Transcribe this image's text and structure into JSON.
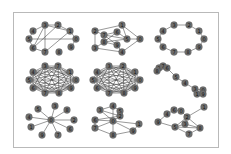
{
  "figure": {
    "layout": "3x3 grid of network graphs",
    "node_color": "#6e6e6e",
    "edge_color": "#333333",
    "frame_color": "#b9b9b9",
    "panels": [
      {
        "name": "graph-1",
        "nodes": [
          {
            "id": "3",
            "x": 45,
            "y": 25
          },
          {
            "id": "2",
            "x": 58,
            "y": 25
          },
          {
            "id": "1",
            "x": 70,
            "y": 31
          },
          {
            "id": "0",
            "x": 76,
            "y": 39
          },
          {
            "id": "9",
            "x": 71,
            "y": 47
          },
          {
            "id": "8",
            "x": 59,
            "y": 52
          },
          {
            "id": "7",
            "x": 45,
            "y": 52
          },
          {
            "id": "6",
            "x": 33,
            "y": 48
          },
          {
            "id": "5",
            "x": 29,
            "y": 39
          },
          {
            "id": "4",
            "x": 33,
            "y": 31
          }
        ],
        "edges": [
          [
            "3",
            "2"
          ],
          [
            "2",
            "1"
          ],
          [
            "1",
            "0"
          ],
          [
            "0",
            "9"
          ],
          [
            "5",
            "0"
          ],
          [
            "3",
            "7"
          ],
          [
            "2",
            "6"
          ],
          [
            "3",
            "6"
          ],
          [
            "4",
            "5"
          ],
          [
            "5",
            "6"
          ],
          [
            "6",
            "7"
          ],
          [
            "3",
            "1"
          ],
          [
            "7",
            "1"
          ],
          [
            "4",
            "3"
          ]
        ]
      },
      {
        "name": "graph-2",
        "nodes": [
          {
            "id": "1",
            "x": 122,
            "y": 25
          },
          {
            "id": "2",
            "x": 95,
            "y": 31
          },
          {
            "id": "6",
            "x": 117,
            "y": 32
          },
          {
            "id": "7",
            "x": 104,
            "y": 35
          },
          {
            "id": "5",
            "x": 127,
            "y": 39
          },
          {
            "id": "0",
            "x": 140,
            "y": 39
          },
          {
            "id": "8",
            "x": 104,
            "y": 42
          },
          {
            "id": "9",
            "x": 117,
            "y": 45
          },
          {
            "id": "3",
            "x": 95,
            "y": 48
          },
          {
            "id": "4",
            "x": 122,
            "y": 52
          }
        ],
        "edges": [
          [
            "2",
            "1"
          ],
          [
            "1",
            "0"
          ],
          [
            "0",
            "5"
          ],
          [
            "0",
            "4"
          ],
          [
            "2",
            "3"
          ],
          [
            "3",
            "4"
          ],
          [
            "2",
            "7"
          ],
          [
            "7",
            "6"
          ],
          [
            "6",
            "5"
          ],
          [
            "7",
            "9"
          ],
          [
            "8",
            "6"
          ],
          [
            "8",
            "9"
          ],
          [
            "9",
            "4"
          ],
          [
            "1",
            "5"
          ],
          [
            "3",
            "8"
          ],
          [
            "5",
            "7"
          ],
          [
            "8",
            "5"
          ]
        ]
      },
      {
        "name": "graph-3",
        "nodes": [
          {
            "id": "3",
            "x": 174,
            "y": 25
          },
          {
            "id": "2",
            "x": 189,
            "y": 25
          },
          {
            "id": "1",
            "x": 199,
            "y": 31
          },
          {
            "id": "0",
            "x": 204,
            "y": 39
          },
          {
            "id": "9",
            "x": 199,
            "y": 47
          },
          {
            "id": "8",
            "x": 188,
            "y": 52
          },
          {
            "id": "7",
            "x": 174,
            "y": 52
          },
          {
            "id": "6",
            "x": 163,
            "y": 47
          },
          {
            "id": "5",
            "x": 158,
            "y": 39
          },
          {
            "id": "4",
            "x": 163,
            "y": 31
          }
        ],
        "edges": [
          [
            "3",
            "2"
          ],
          [
            "2",
            "1"
          ],
          [
            "1",
            "0"
          ],
          [
            "0",
            "9"
          ],
          [
            "9",
            "8"
          ],
          [
            "8",
            "7"
          ],
          [
            "7",
            "6"
          ],
          [
            "6",
            "5"
          ],
          [
            "5",
            "4"
          ],
          [
            "4",
            "3"
          ]
        ]
      },
      {
        "name": "graph-4",
        "nodes": [
          {
            "id": "3",
            "x": 45,
            "y": 66
          },
          {
            "id": "7",
            "x": 58,
            "y": 66
          },
          {
            "id": "1",
            "x": 70,
            "y": 72
          },
          {
            "id": "0",
            "x": 76,
            "y": 80
          },
          {
            "id": "9",
            "x": 71,
            "y": 88
          },
          {
            "id": "8",
            "x": 59,
            "y": 93
          },
          {
            "id": "7b",
            "label": "7",
            "x": 45,
            "y": 93
          },
          {
            "id": "6",
            "x": 33,
            "y": 88
          },
          {
            "id": "5",
            "x": 29,
            "y": 80
          },
          {
            "id": "4",
            "x": 33,
            "y": 72
          }
        ],
        "complete": true
      },
      {
        "name": "graph-5",
        "nodes": [
          {
            "id": "3",
            "x": 109,
            "y": 66
          },
          {
            "id": "2",
            "x": 123,
            "y": 66
          },
          {
            "id": "1",
            "x": 135,
            "y": 72
          },
          {
            "id": "0",
            "x": 140,
            "y": 80
          },
          {
            "id": "9",
            "x": 135,
            "y": 88
          },
          {
            "id": "8",
            "x": 124,
            "y": 93
          },
          {
            "id": "7",
            "x": 109,
            "y": 93
          },
          {
            "id": "6",
            "x": 97,
            "y": 88
          },
          {
            "id": "5",
            "x": 93,
            "y": 80
          },
          {
            "id": "4",
            "x": 97,
            "y": 72
          }
        ],
        "complete": true
      },
      {
        "name": "graph-6",
        "nodes": [
          {
            "id": "2",
            "x": 159,
            "y": 68
          },
          {
            "id": "7",
            "x": 163,
            "y": 66
          },
          {
            "id": "6",
            "x": 167,
            "y": 68
          },
          {
            "id": "8",
            "x": 157,
            "y": 71
          },
          {
            "id": "5",
            "x": 176,
            "y": 77
          },
          {
            "id": "4",
            "x": 185,
            "y": 83
          },
          {
            "id": "3",
            "x": 195,
            "y": 89
          },
          {
            "id": "0",
            "x": 203,
            "y": 90
          },
          {
            "id": "1",
            "x": 197,
            "y": 94
          },
          {
            "id": "9",
            "x": 203,
            "y": 94
          }
        ],
        "edges": [
          [
            "2",
            "7"
          ],
          [
            "7",
            "6"
          ],
          [
            "2",
            "8"
          ],
          [
            "6",
            "5"
          ],
          [
            "5",
            "4"
          ],
          [
            "4",
            "3"
          ],
          [
            "3",
            "0"
          ],
          [
            "3",
            "1"
          ],
          [
            "0",
            "9"
          ],
          [
            "1",
            "9"
          ]
        ]
      },
      {
        "name": "graph-7",
        "nodes": [
          {
            "id": "0",
            "x": 51,
            "y": 120
          },
          {
            "id": "3",
            "x": 55,
            "y": 106
          },
          {
            "id": "5",
            "x": 38,
            "y": 109
          },
          {
            "id": "8",
            "x": 67,
            "y": 110
          },
          {
            "id": "4",
            "x": 29,
            "y": 117
          },
          {
            "id": "2",
            "x": 74,
            "y": 120
          },
          {
            "id": "1",
            "x": 31,
            "y": 127
          },
          {
            "id": "6",
            "x": 70,
            "y": 129
          },
          {
            "id": "9",
            "x": 42,
            "y": 135
          },
          {
            "id": "7",
            "x": 58,
            "y": 135
          }
        ],
        "edges": [
          [
            "0",
            "3"
          ],
          [
            "0",
            "5"
          ],
          [
            "0",
            "8"
          ],
          [
            "0",
            "4"
          ],
          [
            "0",
            "2"
          ],
          [
            "0",
            "1"
          ],
          [
            "0",
            "6"
          ],
          [
            "0",
            "9"
          ],
          [
            "0",
            "7"
          ]
        ]
      },
      {
        "name": "graph-8",
        "nodes": [
          {
            "id": "4",
            "x": 113,
            "y": 106
          },
          {
            "id": "3",
            "x": 100,
            "y": 110
          },
          {
            "id": "5",
            "x": 120,
            "y": 111
          },
          {
            "id": "2",
            "x": 120,
            "y": 116
          },
          {
            "id": "6",
            "x": 95,
            "y": 120
          },
          {
            "id": "0",
            "x": 113,
            "y": 121
          },
          {
            "id": "1",
            "x": 139,
            "y": 124
          },
          {
            "id": "7",
            "x": 95,
            "y": 128
          },
          {
            "id": "8",
            "x": 113,
            "y": 135
          },
          {
            "id": "9",
            "x": 133,
            "y": 131
          }
        ],
        "edges": [
          [
            "4",
            "3"
          ],
          [
            "4",
            "5"
          ],
          [
            "3",
            "0"
          ],
          [
            "5",
            "2"
          ],
          [
            "3",
            "2"
          ],
          [
            "6",
            "0"
          ],
          [
            "6",
            "7"
          ],
          [
            "0",
            "1"
          ],
          [
            "0",
            "7"
          ],
          [
            "0",
            "8"
          ],
          [
            "0",
            "9"
          ],
          [
            "7",
            "8"
          ],
          [
            "8",
            "9"
          ],
          [
            "9",
            "1"
          ],
          [
            "0",
            "2"
          ],
          [
            "6",
            "2"
          ],
          [
            "0",
            "4"
          ]
        ]
      },
      {
        "name": "graph-9",
        "nodes": [
          {
            "id": "1",
            "x": 204,
            "y": 107
          },
          {
            "id": "6",
            "x": 174,
            "y": 110
          },
          {
            "id": "0",
            "x": 181,
            "y": 111
          },
          {
            "id": "4",
            "x": 167,
            "y": 114
          },
          {
            "id": "2",
            "x": 187,
            "y": 117
          },
          {
            "id": "3",
            "x": 185,
            "y": 124
          },
          {
            "id": "9",
            "x": 158,
            "y": 122
          },
          {
            "id": "5",
            "x": 175,
            "y": 127
          },
          {
            "id": "8",
            "x": 200,
            "y": 128
          },
          {
            "id": "7",
            "x": 189,
            "y": 134
          }
        ],
        "edges": [
          [
            "2",
            "1"
          ],
          [
            "6",
            "0"
          ],
          [
            "0",
            "2"
          ],
          [
            "4",
            "6"
          ],
          [
            "4",
            "9"
          ],
          [
            "9",
            "5"
          ],
          [
            "5",
            "2"
          ],
          [
            "5",
            "3"
          ],
          [
            "5",
            "7"
          ],
          [
            "3",
            "8"
          ],
          [
            "2",
            "8"
          ],
          [
            "7",
            "8"
          ],
          [
            "3",
            "2"
          ],
          [
            "5",
            "8"
          ]
        ]
      }
    ]
  }
}
